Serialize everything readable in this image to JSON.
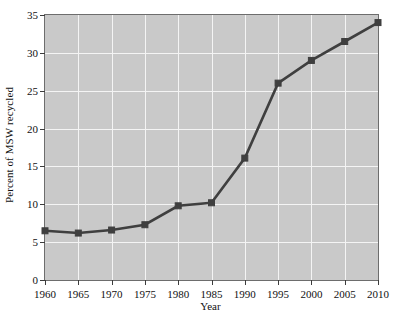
{
  "chart_data": {
    "type": "line",
    "title": "",
    "xlabel": "Year",
    "ylabel": "Percent of MSW recycled",
    "x": [
      1960,
      1965,
      1970,
      1975,
      1980,
      1985,
      1990,
      1995,
      2000,
      2005,
      2010
    ],
    "values": [
      6.5,
      6.2,
      6.6,
      7.3,
      9.8,
      10.2,
      16.1,
      26.0,
      29.0,
      31.5,
      34.0
    ],
    "xlim": [
      1960,
      2010
    ],
    "ylim": [
      0,
      35
    ],
    "xticks": [
      1960,
      1965,
      1970,
      1975,
      1980,
      1985,
      1990,
      1995,
      2000,
      2005,
      2010
    ],
    "xtick_labels": [
      "1960",
      "1965",
      "1970",
      "1975",
      "1980",
      "1985",
      "1990",
      "1995",
      "2000",
      "2005",
      "2010"
    ],
    "yticks": [
      0,
      5,
      10,
      15,
      20,
      25,
      30,
      35
    ],
    "ytick_labels": [
      "0",
      "5",
      "10",
      "15",
      "20",
      "25",
      "30",
      "35"
    ],
    "grid": true,
    "legend": false,
    "marker": "square",
    "colors": {
      "line": "#3f3f3f",
      "marker": "#3f3f3f",
      "plot_background": "#c9c9c9",
      "gridline": "#f4f4f4",
      "axis": "#6d6d6d",
      "text": "#111111",
      "page_background": "#ffffff"
    }
  }
}
